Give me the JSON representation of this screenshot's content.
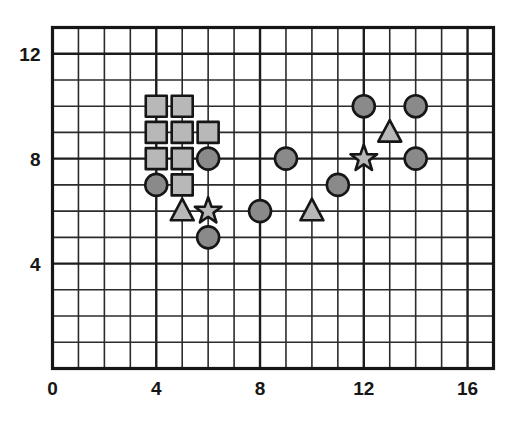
{
  "chart_data": {
    "type": "scatter",
    "title": "",
    "subtitle": "",
    "xlabel": "",
    "ylabel": "",
    "xlim": [
      0,
      17
    ],
    "ylim": [
      0,
      13
    ],
    "xticks": [
      0,
      4,
      8,
      12,
      16
    ],
    "yticks": [
      4,
      8,
      12
    ],
    "xtick_labels": [
      "0",
      "4",
      "8",
      "12",
      "16"
    ],
    "ytick_labels": [
      "4",
      "8",
      "12"
    ],
    "grid": true,
    "grid_step": 1,
    "legend": "none",
    "annotations": [],
    "series": [
      {
        "name": "squares",
        "marker": "square",
        "fill_color": "#b8b8b8",
        "edge_color": "#161616",
        "points": [
          {
            "x": 4,
            "y": 10
          },
          {
            "x": 5,
            "y": 10
          },
          {
            "x": 4,
            "y": 9
          },
          {
            "x": 5,
            "y": 9
          },
          {
            "x": 6,
            "y": 9
          },
          {
            "x": 4,
            "y": 8
          },
          {
            "x": 5,
            "y": 8
          },
          {
            "x": 5,
            "y": 7
          }
        ]
      },
      {
        "name": "circles",
        "marker": "circle",
        "fill_color": "#8a8a8a",
        "edge_color": "#161616",
        "points": [
          {
            "x": 4,
            "y": 7
          },
          {
            "x": 6,
            "y": 8
          },
          {
            "x": 6,
            "y": 5
          },
          {
            "x": 8,
            "y": 6
          },
          {
            "x": 9,
            "y": 8
          },
          {
            "x": 11,
            "y": 7
          },
          {
            "x": 12,
            "y": 10
          },
          {
            "x": 14,
            "y": 10
          },
          {
            "x": 14,
            "y": 8
          }
        ]
      },
      {
        "name": "triangles",
        "marker": "triangle",
        "fill_color": "#b8b8b8",
        "edge_color": "#161616",
        "points": [
          {
            "x": 5,
            "y": 6
          },
          {
            "x": 10,
            "y": 6
          },
          {
            "x": 13,
            "y": 9
          }
        ]
      },
      {
        "name": "stars",
        "marker": "star",
        "fill_color": "#b8b8b8",
        "edge_color": "#161616",
        "points": [
          {
            "x": 6,
            "y": 6
          },
          {
            "x": 12,
            "y": 8
          }
        ]
      }
    ]
  },
  "colors": {
    "background": "#ffffff",
    "grid": "#2b2b2b",
    "frame": "#161616",
    "square_fill": "#b8b8b8",
    "circle_fill": "#8a8a8a",
    "triangle_fill": "#b8b8b8",
    "star_fill": "#b8b8b8",
    "tick_text": "#161616"
  }
}
